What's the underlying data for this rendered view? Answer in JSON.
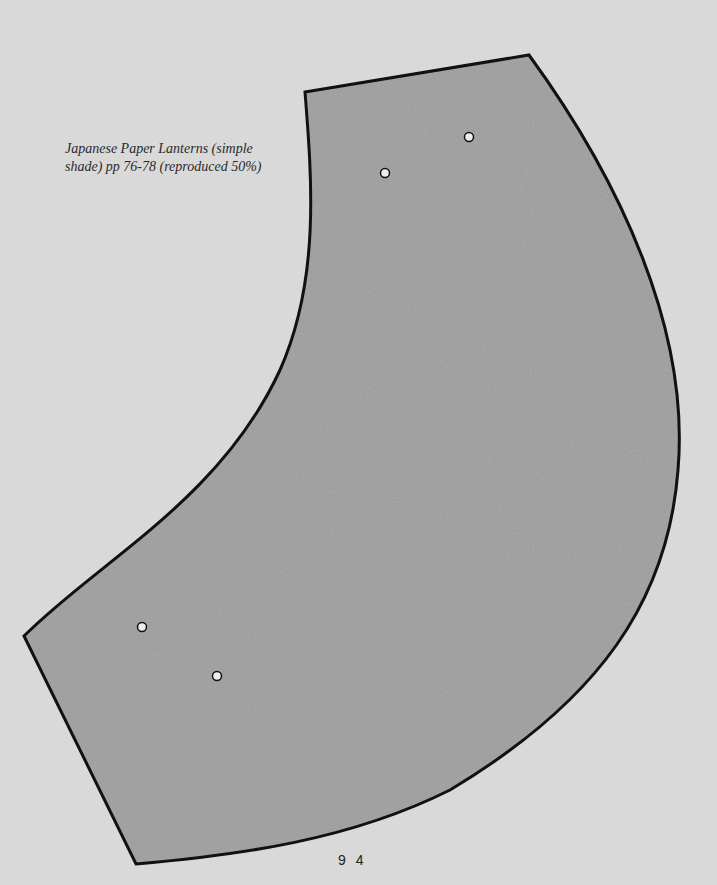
{
  "caption": {
    "line1": "Japanese Paper Lanterns (simple",
    "line2": "shade) pp 76-78 (reproduced 50%)"
  },
  "page_number": "9 4",
  "pattern": {
    "name": "lantern-shade-template",
    "fill_color": "#9b9b9b",
    "outline_color": "#111111",
    "background_color": "#dcdcdc",
    "holes": [
      {
        "x": 469,
        "y": 137
      },
      {
        "x": 385,
        "y": 173
      },
      {
        "x": 142,
        "y": 627
      },
      {
        "x": 217,
        "y": 676
      }
    ]
  }
}
